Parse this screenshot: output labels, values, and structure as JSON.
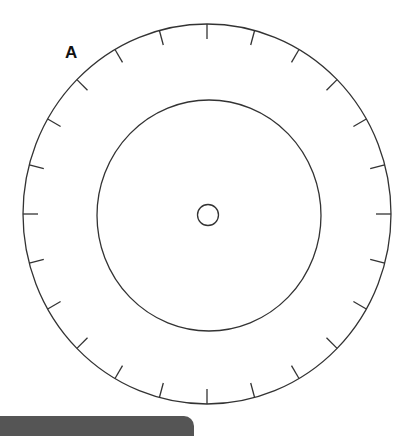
{
  "diagram": {
    "label": "A",
    "stroke_color": "#333333",
    "bar_color": "#555555",
    "outer_circle": {
      "cx": 207,
      "cy": 214,
      "rx": 184,
      "ry": 190
    },
    "inner_circle": {
      "cx": 209,
      "cy": 215.5,
      "rx": 112,
      "ry": 115.5
    },
    "center_circle": {
      "cx": 208,
      "cy": 215,
      "r": 10.5
    },
    "ticks": {
      "count": 24,
      "length": 15,
      "start_angle_deg": 0
    }
  }
}
